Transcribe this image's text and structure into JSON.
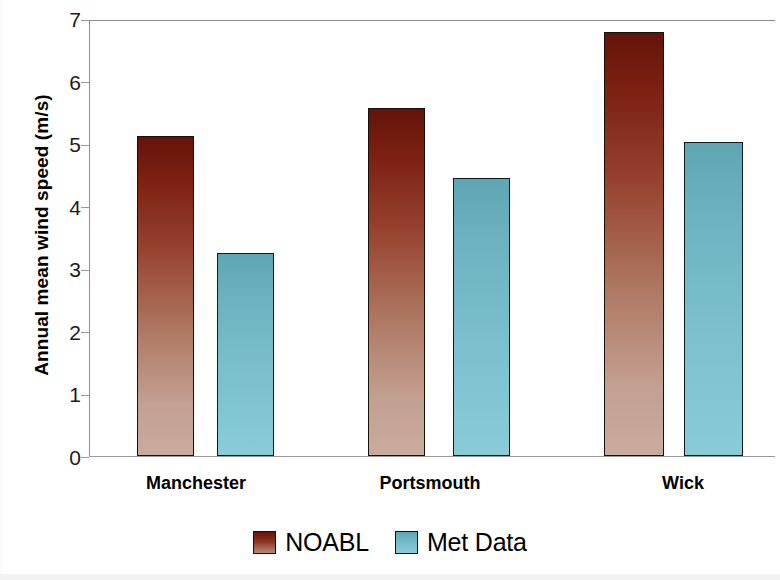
{
  "chart_data": {
    "type": "bar",
    "title": "",
    "xlabel": "",
    "ylabel": "Annual mean wind speed (m/s)",
    "categories": [
      "Manchester",
      "Portsmouth",
      "Wick"
    ],
    "series": [
      {
        "name": "NOABL",
        "color": "#7d2113",
        "values": [
          5.15,
          5.6,
          6.82
        ]
      },
      {
        "name": "Met Data",
        "color": "#6eb3c1",
        "values": [
          3.27,
          4.48,
          5.05
        ]
      }
    ],
    "ylim": [
      0,
      7
    ],
    "y_ticks": [
      0,
      1,
      2,
      3,
      4,
      5,
      6,
      7
    ],
    "y_tick_labels": [
      "0",
      "1",
      "2",
      "3",
      "4",
      "5",
      "6",
      "7"
    ],
    "grid": false,
    "legend_position": "bottom"
  },
  "axes": {
    "y_title": "Annual mean wind speed (m/s)",
    "y_tick_labels": [
      "7",
      "6",
      "5",
      "4",
      "3",
      "2",
      "1",
      "0"
    ],
    "x_tick_labels": [
      "Manchester",
      "Portsmouth",
      "Wick"
    ]
  },
  "legend": {
    "entries": [
      {
        "label": "NOABL",
        "swatch": "noabl-swatch"
      },
      {
        "label": "Met Data",
        "swatch": "met-data-swatch"
      }
    ]
  }
}
